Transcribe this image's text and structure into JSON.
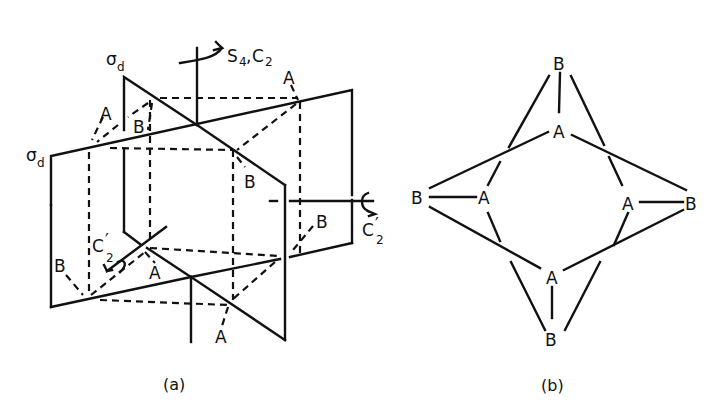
{
  "figure_a": {
    "caption": "(a)",
    "axes": {
      "principal": {
        "label": "S",
        "sub1": "4",
        "sep": ",",
        "label2": "C",
        "sub2": "2"
      },
      "c2_prime_front": {
        "label": "C",
        "prime": "′",
        "sub": "2"
      },
      "c2_prime_right": {
        "label": "C",
        "prime": "′",
        "sub": "2"
      }
    },
    "planes": {
      "sigma_d_back": {
        "label": "σ",
        "sub": "d"
      },
      "sigma_d_front": {
        "label": "σ",
        "sub": "d"
      }
    },
    "atoms": [
      {
        "id": "a1",
        "label": "A"
      },
      {
        "id": "b1",
        "label": "B"
      },
      {
        "id": "a2",
        "label": "A"
      },
      {
        "id": "b2",
        "label": "B"
      },
      {
        "id": "b3",
        "label": "B"
      },
      {
        "id": "b4",
        "label": "B"
      },
      {
        "id": "a3",
        "label": "A"
      },
      {
        "id": "a4",
        "label": "A"
      }
    ]
  },
  "figure_b": {
    "caption": "(b)",
    "atoms": [
      {
        "id": "top_b",
        "label": "B"
      },
      {
        "id": "top_a",
        "label": "A"
      },
      {
        "id": "left_b",
        "label": "B"
      },
      {
        "id": "left_a",
        "label": "A"
      },
      {
        "id": "right_a",
        "label": "A"
      },
      {
        "id": "right_b",
        "label": "B"
      },
      {
        "id": "bottom_a",
        "label": "A"
      },
      {
        "id": "bottom_b",
        "label": "B"
      }
    ]
  }
}
